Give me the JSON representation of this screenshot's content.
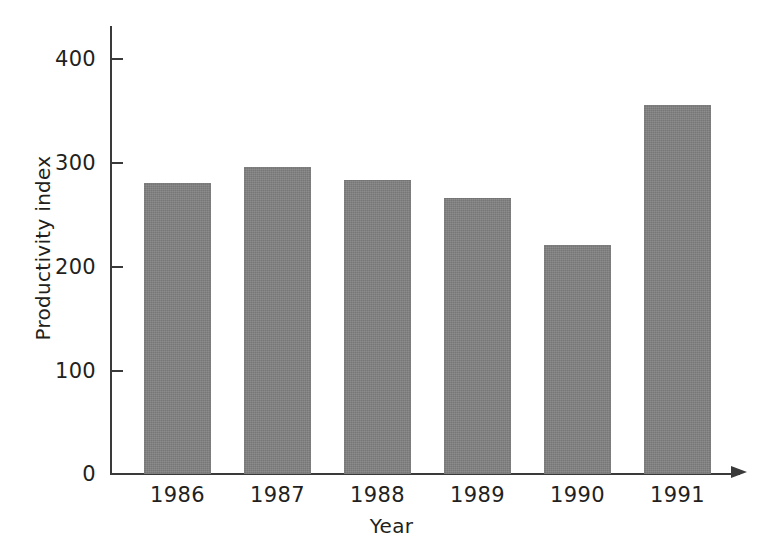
{
  "chart_data": {
    "type": "bar",
    "title": "",
    "subtitle": "",
    "xlabel": "Year",
    "ylabel": "Productivity index",
    "categories": [
      "1986",
      "1987",
      "1988",
      "1989",
      "1990",
      "1991"
    ],
    "values": [
      280,
      295,
      283,
      265,
      220,
      355
    ],
    "ylim": [
      0,
      430
    ],
    "yticks": [
      0,
      100,
      200,
      300,
      400
    ],
    "ytick_labels": [
      "0",
      "100",
      "200",
      "300",
      "400"
    ],
    "grid": false,
    "legend": null,
    "annotations": [],
    "series": [
      {
        "name": "Productivity index",
        "values": [
          280,
          295,
          283,
          265,
          220,
          355
        ],
        "color": "#7f7f7f"
      }
    ],
    "axis_style": {
      "x_axis_arrow": true,
      "y_axis_arrow": false,
      "axis_color": "#3b3a3a",
      "background": "#ffffff"
    }
  }
}
